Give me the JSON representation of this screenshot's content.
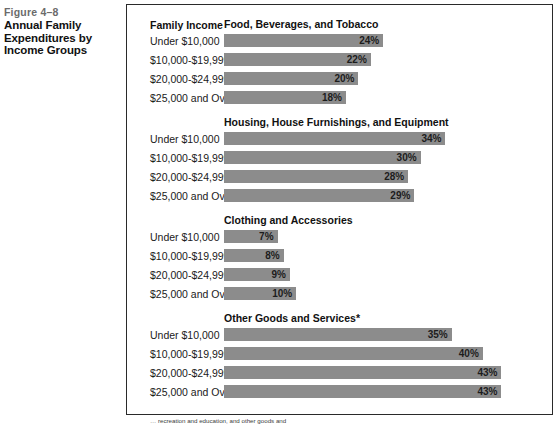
{
  "caption": {
    "figure_number": "Figure 4–8",
    "title_line1": "Annual Family",
    "title_line2": "Expenditures by",
    "title_line3": "Income Groups"
  },
  "column_header": "Family Income",
  "footnote": "… recreation and education, and other goods and",
  "colors": {
    "bar_fill": "#8c8c8c",
    "frame_border": "#2a2a2a",
    "figure_number": "#6b6b6b",
    "text": "#111111"
  },
  "chart_data": {
    "type": "bar",
    "title": "Annual Family Expenditures by Income Groups",
    "xlabel": "",
    "ylabel": "Family Income",
    "xlim": [
      0,
      45
    ],
    "grid": false,
    "legend": "none",
    "orientation": "horizontal",
    "value_suffix": "%",
    "categories": [
      "Under $10,000",
      "$10,000-$19,999",
      "$20,000-$24,999",
      "$25,000 and Over"
    ],
    "panels": [
      {
        "title": "Food, Beverages, and Tobacco",
        "values": [
          24,
          22,
          20,
          18
        ],
        "labels": [
          "24%",
          "22%",
          "20%",
          "18%"
        ]
      },
      {
        "title": "Housing, House Furnishings, and Equipment",
        "values": [
          34,
          30,
          28,
          29
        ],
        "labels": [
          "34%",
          "30%",
          "28%",
          "29%"
        ]
      },
      {
        "title": "Clothing and Accessories",
        "values": [
          7,
          8,
          9,
          10
        ],
        "labels": [
          "7%",
          "8%",
          "9%",
          "10%"
        ]
      },
      {
        "title": "Other Goods and Services*",
        "values": [
          35,
          40,
          43,
          43
        ],
        "labels": [
          "35%",
          "40%",
          "43%",
          "43%"
        ]
      }
    ]
  }
}
